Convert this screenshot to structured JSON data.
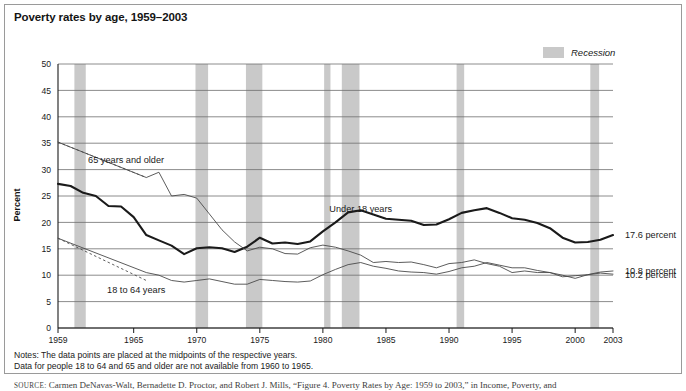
{
  "figure": {
    "title": "Poverty rates by age, 1959–2003",
    "notes_line1": "Notes: The data points are placed at the midpoints of the respective years.",
    "notes_line2": "Data for people 18 to 64 and 65 and older are not available from 1960 to 1965.",
    "source_prefix": "SOURCE:",
    "source_text": "Carmen DeNavas-Walt, Bernadette D. Proctor, and Robert J. Mills, “Figure 4. Poverty Rates by Age: 1959 to 2003,” in Income, Poverty, and"
  },
  "legend": {
    "position": "top-right",
    "entries": [
      {
        "label": "Recession",
        "color": "#c9c9c9",
        "swatch": "band"
      }
    ]
  },
  "colors": {
    "recession_band": "#c9c9c9",
    "grid": "#6f6f6f",
    "axis": "#1a1a1a",
    "under18": "#1a1a1a",
    "age18to64": "#4a4a4a",
    "age65plus": "#4a4a4a",
    "frame": "#9a9a9a"
  },
  "chart_data": {
    "type": "line",
    "title": "Poverty rates by age, 1959–2003",
    "xlabel": "",
    "ylabel": "Percent",
    "xlim": [
      1959,
      2003
    ],
    "ylim": [
      0,
      50
    ],
    "yticks": [
      0,
      5,
      10,
      15,
      20,
      25,
      30,
      35,
      40,
      45,
      50
    ],
    "xticks": [
      1959,
      1965,
      1970,
      1975,
      1980,
      1985,
      1990,
      1995,
      2000,
      2003
    ],
    "grid": "horizontal",
    "x": [
      1959,
      1960,
      1961,
      1962,
      1963,
      1964,
      1965,
      1966,
      1967,
      1968,
      1969,
      1970,
      1971,
      1972,
      1973,
      1974,
      1975,
      1976,
      1977,
      1978,
      1979,
      1980,
      1981,
      1982,
      1983,
      1984,
      1985,
      1986,
      1987,
      1988,
      1989,
      1990,
      1991,
      1992,
      1993,
      1994,
      1995,
      1996,
      1997,
      1998,
      1999,
      2000,
      2001,
      2002,
      2003
    ],
    "series": [
      {
        "name": "Under 18 years",
        "label": "Under 18 years",
        "style": "solid-thick",
        "color": "#1a1a1a",
        "end_label": "17.6 percent",
        "values": [
          27.3,
          26.9,
          25.6,
          25.0,
          23.1,
          23.0,
          21.0,
          17.6,
          16.6,
          15.6,
          14.0,
          15.1,
          15.3,
          15.1,
          14.4,
          15.4,
          17.1,
          16.0,
          16.2,
          15.9,
          16.4,
          18.3,
          20.0,
          21.9,
          22.3,
          21.5,
          20.7,
          20.5,
          20.3,
          19.5,
          19.6,
          20.6,
          21.8,
          22.3,
          22.7,
          21.8,
          20.8,
          20.5,
          19.9,
          18.9,
          17.1,
          16.2,
          16.3,
          16.7,
          17.6
        ]
      },
      {
        "name": "18 to 64 years",
        "label": "18 to 64 years",
        "style": "solid-thin",
        "color": "#4a4a4a",
        "end_label": "10.8 percent",
        "dashed_segment": {
          "from": 1959,
          "to": 1966,
          "values": [
            17.0,
            9.0
          ]
        },
        "values": [
          17.0,
          null,
          null,
          null,
          null,
          null,
          null,
          10.5,
          10.0,
          9.0,
          8.7,
          9.0,
          9.3,
          8.8,
          8.3,
          8.3,
          9.2,
          9.0,
          8.8,
          8.7,
          8.9,
          10.1,
          11.1,
          12.0,
          12.4,
          11.7,
          11.3,
          10.8,
          10.6,
          10.5,
          10.2,
          10.7,
          11.4,
          11.7,
          12.4,
          11.9,
          11.4,
          11.4,
          10.9,
          10.5,
          10.0,
          9.4,
          10.1,
          10.6,
          10.8
        ]
      },
      {
        "name": "65 years and older",
        "label": "65 years and older",
        "style": "solid-thin",
        "color": "#4a4a4a",
        "end_label": "10.2 percent",
        "dashed_segment": {
          "from": 1959,
          "to": 1966,
          "values": [
            35.2,
            28.5
          ]
        },
        "values": [
          35.2,
          null,
          null,
          null,
          null,
          null,
          null,
          28.5,
          29.5,
          25.0,
          25.3,
          24.6,
          21.6,
          18.6,
          16.3,
          14.6,
          15.3,
          15.0,
          14.1,
          14.0,
          15.2,
          15.7,
          15.3,
          14.6,
          13.8,
          12.4,
          12.6,
          12.4,
          12.5,
          12.0,
          11.4,
          12.2,
          12.4,
          12.9,
          12.2,
          11.7,
          10.5,
          10.8,
          10.5,
          10.5,
          9.7,
          9.9,
          10.1,
          10.4,
          10.2
        ]
      }
    ],
    "recessions": [
      {
        "start": 1960.3,
        "end": 1961.2
      },
      {
        "start": 1969.9,
        "end": 1970.9
      },
      {
        "start": 1973.9,
        "end": 1975.2
      },
      {
        "start": 1980.1,
        "end": 1980.6
      },
      {
        "start": 1981.5,
        "end": 1982.9
      },
      {
        "start": 1990.6,
        "end": 1991.2
      },
      {
        "start": 2001.2,
        "end": 2001.9
      }
    ],
    "annotations": [
      {
        "text": "65 years and older",
        "x": 1964.4,
        "y": 31.2
      },
      {
        "text": "18 to 64 years",
        "x": 1965.2,
        "y": 6.6
      },
      {
        "text": "Under 18 years",
        "x": 1983.0,
        "y": 21.9
      }
    ]
  }
}
